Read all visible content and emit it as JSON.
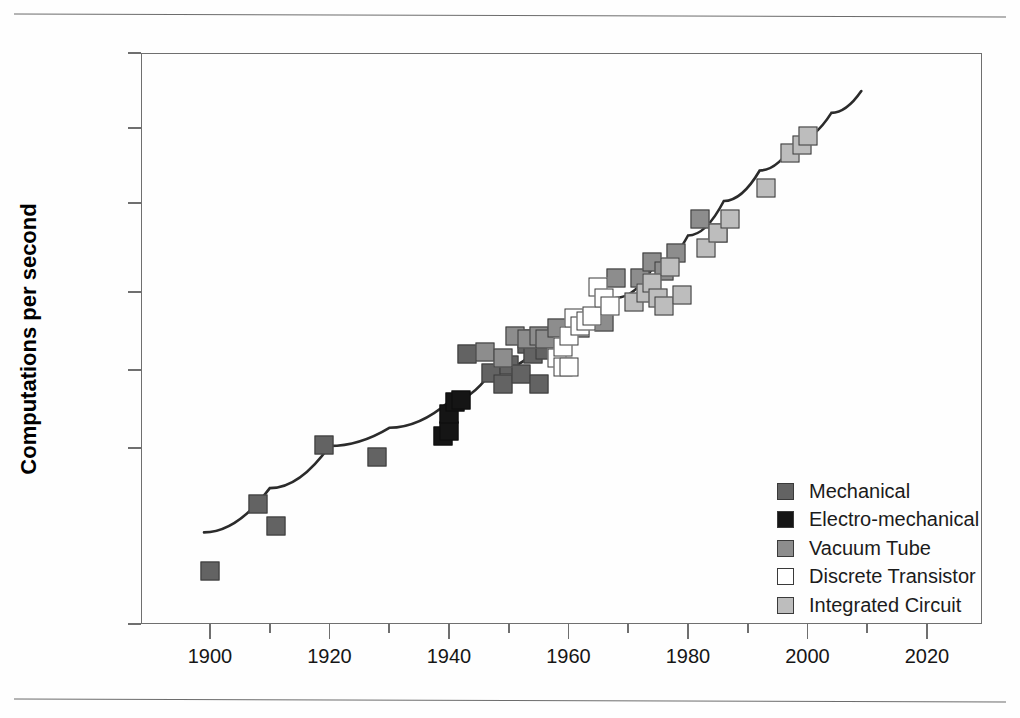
{
  "chart_data": {
    "type": "scatter",
    "title": "",
    "xlabel": "",
    "ylabel": "Computations per second",
    "xlim": [
      1890,
      2030
    ],
    "ylim": [
      1e-05,
      1000000000000.0
    ],
    "yscale": "log",
    "grid": false,
    "legend_position": "inside-right",
    "x_ticks_major": [
      "1900",
      "1920",
      "1940",
      "1960",
      "1980",
      "2000",
      "2020"
    ],
    "x_ticks_major_values": [
      1900,
      1920,
      1940,
      1960,
      1980,
      2000,
      2020
    ],
    "x_ticks_minor_values": [
      1910,
      1930,
      1950,
      1970,
      1990,
      2010
    ],
    "y_ticks": [
      "1E+12",
      "1E+9",
      "1E+6",
      "1E+3",
      "1E+0",
      "1E-3",
      "1E-5"
    ],
    "y_tick_values": [
      1000000000000.0,
      1000000000.0,
      1000000.0,
      1000.0,
      1,
      0.001,
      1e-05
    ],
    "series": [
      {
        "name": "Mechanical",
        "color": "#636363",
        "marker": "square",
        "points": [
          {
            "x": 1900,
            "y": 4e-05
          },
          {
            "x": 1908,
            "y": 0.00023
          },
          {
            "x": 1911,
            "y": 0.00013
          },
          {
            "x": 1919,
            "y": 0.0013
          },
          {
            "x": 1928,
            "y": 0.0008
          },
          {
            "x": 1943,
            "y": 4.0
          },
          {
            "x": 1947,
            "y": 0.8
          },
          {
            "x": 1949,
            "y": 0.3
          },
          {
            "x": 1950,
            "y": 1.6
          },
          {
            "x": 1952,
            "y": 0.7
          },
          {
            "x": 1953,
            "y": 10.0
          },
          {
            "x": 1954,
            "y": 15.0
          },
          {
            "x": 1954,
            "y": 4.0
          },
          {
            "x": 1955,
            "y": 0.3
          },
          {
            "x": 1956,
            "y": 6.0
          }
        ]
      },
      {
        "name": "Electro-mechanical",
        "color": "#151515",
        "marker": "square",
        "points": [
          {
            "x": 1939,
            "y": 0.003
          },
          {
            "x": 1940,
            "y": 0.0045
          },
          {
            "x": 1940,
            "y": 0.02
          },
          {
            "x": 1941,
            "y": 0.06
          },
          {
            "x": 1942,
            "y": 0.07
          }
        ]
      },
      {
        "name": "Vacuum Tube",
        "color": "#8d8d8d",
        "marker": "square",
        "points": [
          {
            "x": 1946,
            "y": 5.0
          },
          {
            "x": 1949,
            "y": 3.0
          },
          {
            "x": 1951,
            "y": 20.0
          },
          {
            "x": 1953,
            "y": 15.0
          },
          {
            "x": 1955,
            "y": 20.0
          },
          {
            "x": 1956,
            "y": 15.0
          },
          {
            "x": 1958,
            "y": 40.0
          },
          {
            "x": 1962,
            "y": 40.0
          },
          {
            "x": 1966,
            "y": 70.0
          },
          {
            "x": 1968,
            "y": 3000.0
          },
          {
            "x": 1972,
            "y": 3000.0
          },
          {
            "x": 1974,
            "y": 10000.0
          },
          {
            "x": 1976,
            "y": 5000.0
          },
          {
            "x": 1978,
            "y": 20000.0
          },
          {
            "x": 1982,
            "y": 300000.0
          },
          {
            "x": 1985,
            "y": 100000.0
          }
        ]
      },
      {
        "name": "Discrete Transistor",
        "color": "#ffffff",
        "marker": "square",
        "points": [
          {
            "x": 1958,
            "y": 3.0
          },
          {
            "x": 1959,
            "y": 1.3
          },
          {
            "x": 1959,
            "y": 8.0
          },
          {
            "x": 1960,
            "y": 1.3
          },
          {
            "x": 1960,
            "y": 20.0
          },
          {
            "x": 1961,
            "y": 100.0
          },
          {
            "x": 1962,
            "y": 50.0
          },
          {
            "x": 1963,
            "y": 80.0
          },
          {
            "x": 1964,
            "y": 120.0
          },
          {
            "x": 1965,
            "y": 1500.0
          },
          {
            "x": 1966,
            "y": 600.0
          },
          {
            "x": 1967,
            "y": 300.0
          }
        ]
      },
      {
        "name": "Integrated Circuit",
        "color": "#bdbdbd",
        "marker": "square",
        "points": [
          {
            "x": 1971,
            "y": 400.0
          },
          {
            "x": 1973,
            "y": 900.0
          },
          {
            "x": 1974,
            "y": 2000.0
          },
          {
            "x": 1975,
            "y": 600.0
          },
          {
            "x": 1976,
            "y": 300.0
          },
          {
            "x": 1977,
            "y": 7000.0
          },
          {
            "x": 1979,
            "y": 800.0
          },
          {
            "x": 1983,
            "y": 30000.0
          },
          {
            "x": 1985,
            "y": 100000.0
          },
          {
            "x": 1987,
            "y": 300000.0
          },
          {
            "x": 1993,
            "y": 4000000.0
          },
          {
            "x": 1997,
            "y": 100000000.0
          },
          {
            "x": 1999,
            "y": 200000000.0
          },
          {
            "x": 2000,
            "y": 500000000.0
          }
        ]
      }
    ],
    "trend": {
      "name": "exponential-fit",
      "color": "#2b2b2b",
      "points": [
        {
          "x": 1899,
          "y": 0.00011
        },
        {
          "x": 1910,
          "y": 0.00035
        },
        {
          "x": 1920,
          "y": 0.0012
        },
        {
          "x": 1930,
          "y": 0.006
        },
        {
          "x": 1940,
          "y": 0.06
        },
        {
          "x": 1947,
          "y": 0.8
        },
        {
          "x": 1955,
          "y": 7.0
        },
        {
          "x": 1962,
          "y": 60.0
        },
        {
          "x": 1968,
          "y": 600.0
        },
        {
          "x": 1974,
          "y": 6000.0
        },
        {
          "x": 1980,
          "y": 80000.0
        },
        {
          "x": 1986,
          "y": 1200000.0
        },
        {
          "x": 1992,
          "y": 20000000.0
        },
        {
          "x": 1998,
          "y": 300000000.0
        },
        {
          "x": 2004,
          "y": 4000000000.0
        },
        {
          "x": 2009,
          "y": 30000000000.0
        }
      ]
    }
  },
  "legend": {
    "items": [
      {
        "label": "Mechanical",
        "swatch": "#636363"
      },
      {
        "label": "Electro-mechanical",
        "swatch": "#151515"
      },
      {
        "label": "Vacuum Tube",
        "swatch": "#8d8d8d"
      },
      {
        "label": "Discrete Transistor",
        "swatch": "#ffffff"
      },
      {
        "label": "Integrated Circuit",
        "swatch": "#bdbdbd"
      }
    ]
  },
  "colors": {
    "axis": "#6f6f6f",
    "rule": "#6c6c6c",
    "text": "#161616",
    "trend": "#2b2b2b"
  }
}
